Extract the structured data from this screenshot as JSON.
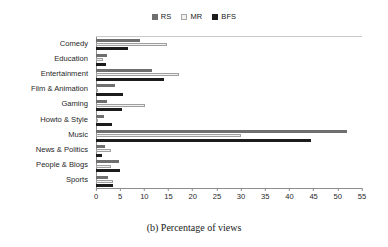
{
  "caption": "(b) Percentage of views",
  "legend": {
    "position": "top-center",
    "entries": [
      {
        "label": "RS",
        "color": "#6f6f6f",
        "swatch": "legend-swatch-rs"
      },
      {
        "label": "MR",
        "color": "#f1f1f1",
        "swatch": "legend-swatch-mr"
      },
      {
        "label": "BFS",
        "color": "#1c1c1c",
        "swatch": "legend-swatch-bfs"
      }
    ]
  },
  "chart_data": {
    "type": "bar",
    "orientation": "horizontal",
    "title": "(b) Percentage of views",
    "xlabel": "",
    "ylabel": "",
    "xlim": [
      0,
      55
    ],
    "xticks": [
      0,
      5,
      10,
      15,
      20,
      25,
      30,
      35,
      40,
      45,
      50,
      55
    ],
    "grid": false,
    "legend_position": "top-center",
    "categories": [
      "Comedy",
      "Education",
      "Entertainment",
      "Film & Animation",
      "Gaming",
      "Howto & Style",
      "Music",
      "News & Politics",
      "People & Blogs",
      "Sports"
    ],
    "series": [
      {
        "name": "RS",
        "color": "#6f6f6f",
        "values": [
          9.0,
          2.2,
          11.5,
          4.0,
          2.3,
          1.6,
          51.8,
          1.8,
          4.8,
          2.5
        ]
      },
      {
        "name": "MR",
        "color": "#f1f1f1",
        "values": [
          14.7,
          1.5,
          17.1,
          0.4,
          10.1,
          0.3,
          30.0,
          3.0,
          3.0,
          3.6
        ]
      },
      {
        "name": "BFS",
        "color": "#1c1c1c",
        "values": [
          6.7,
          2.1,
          14.0,
          5.5,
          5.3,
          3.4,
          44.5,
          1.3,
          5.0,
          3.6
        ]
      }
    ]
  }
}
